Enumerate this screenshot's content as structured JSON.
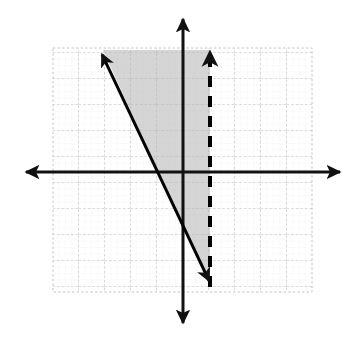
{
  "figure": {
    "title": "",
    "background_color": "#ffffff",
    "width": 354,
    "height": 340
  },
  "chart_data": {
    "type": "scatter",
    "title": "",
    "xlabel": "",
    "ylabel": "",
    "plot_kind": "linear-inequality-system-graph",
    "grid": {
      "visible": true,
      "style": "dotted",
      "color": "#bfbfbf",
      "minor_color": "#d9d9d9",
      "spacing_px": 26,
      "x_range_units": [
        -5,
        5
      ],
      "y_range_units": [
        -4.8,
        4.8
      ],
      "panel_px": {
        "left": 53,
        "top": 48,
        "right": 312,
        "bottom": 292
      },
      "origin_px": {
        "x": 183,
        "y": 172
      }
    },
    "axes": {
      "x_axis": {
        "label": "x",
        "color": "#000000",
        "arrow_both_ends": true,
        "from_px": {
          "x": 23,
          "y": 172
        },
        "to_px": {
          "x": 343,
          "y": 172
        }
      },
      "y_axis": {
        "label": "y",
        "color": "#000000",
        "arrow_both_ends": true,
        "from_px": {
          "x": 183,
          "y": 16
        },
        "to_px": {
          "x": 183,
          "y": 326
        }
      }
    },
    "series": [
      {
        "name": "boundary-line-solid",
        "kind": "line",
        "style": "solid",
        "color": "#000000",
        "width_px": 3,
        "arrow_start": true,
        "arrow_end": true,
        "inequality": "y <= -3x + 1",
        "slope": -3,
        "y_intercept": 1,
        "points_units": [
          [
            -3.2,
            10.6
          ],
          [
            1.04,
            -2.1
          ]
        ],
        "points_px": [
          [
            100,
            50
          ],
          [
            211,
            285
          ]
        ]
      },
      {
        "name": "boundary-line-dashed",
        "kind": "line",
        "style": "dashed",
        "color": "#000000",
        "width_px": 4,
        "dash_px": [
          11,
          9
        ],
        "arrow_start": false,
        "arrow_end": true,
        "inequality": "x < 1",
        "equation": "x = 1",
        "points_units": [
          [
            1,
            -4.4
          ],
          [
            1,
            4.8
          ]
        ],
        "points_px": [
          [
            210,
            287
          ],
          [
            210,
            48
          ]
        ]
      }
    ],
    "shaded_region": {
      "name": "solution-region",
      "fill_color": "#b3b3b3",
      "opacity": 0.55,
      "description": "Region between the solid line and the dashed vertical line, above the solid line",
      "vertices_px": [
        [
          103,
          50
        ],
        [
          210,
          50
        ],
        [
          210,
          287
        ],
        [
          103,
          50
        ]
      ]
    },
    "legend": {
      "visible": false,
      "entries": []
    },
    "annotations": []
  }
}
